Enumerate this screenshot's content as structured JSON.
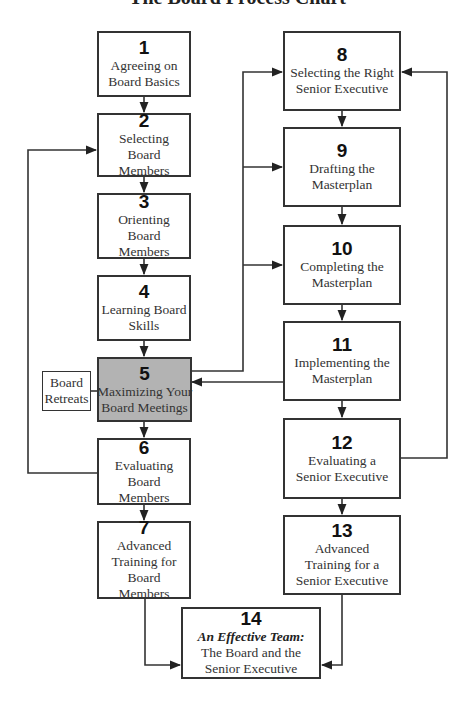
{
  "title": "The Board Process Chart",
  "colors": {
    "box_border": "#333333",
    "highlight_fill": "#b3b3b3",
    "background": "#ffffff"
  },
  "boxes": {
    "b1": {
      "number": "1",
      "line1": "Agreeing on",
      "line2": "Board Basics"
    },
    "b2": {
      "number": "2",
      "line1": "Selecting Board",
      "line2": "Members"
    },
    "b3": {
      "number": "3",
      "line1": "Orienting Board",
      "line2": "Members"
    },
    "b4": {
      "number": "4",
      "line1": "Learning Board",
      "line2": "Skills"
    },
    "b5": {
      "number": "5",
      "line1": "Maximizing Your",
      "line2": "Board Meetings",
      "highlighted": true
    },
    "b6": {
      "number": "6",
      "line1": "Evaluating",
      "line2": "Board Members"
    },
    "b7": {
      "number": "7",
      "line1": "Advanced",
      "line2": "Training for",
      "line3": "Board Members"
    },
    "b8": {
      "number": "8",
      "line1": "Selecting the Right",
      "line2": "Senior Executive"
    },
    "b9": {
      "number": "9",
      "line1": "Drafting the",
      "line2": "Masterplan"
    },
    "b10": {
      "number": "10",
      "line1": "Completing the",
      "line2": "Masterplan"
    },
    "b11": {
      "number": "11",
      "line1": "Implementing the",
      "line2": "Masterplan"
    },
    "b12": {
      "number": "12",
      "line1": "Evaluating a",
      "line2": "Senior Executive"
    },
    "b13": {
      "number": "13",
      "line1": "Advanced",
      "line2": "Training for a",
      "line3": "Senior Executive"
    },
    "b14": {
      "number": "14",
      "emphasis": "An Effective Team:",
      "line1": "The Board and the",
      "line2": "Senior Executive"
    }
  },
  "side_note": {
    "line1": "Board",
    "line2": "Retreats"
  },
  "connections": [
    {
      "from": "1",
      "to": "2"
    },
    {
      "from": "2",
      "to": "3"
    },
    {
      "from": "3",
      "to": "4"
    },
    {
      "from": "4",
      "to": "5"
    },
    {
      "from": "5",
      "to": "6"
    },
    {
      "from": "6",
      "to": "7"
    },
    {
      "from": "6",
      "to": "2",
      "type": "loop"
    },
    {
      "from": "5",
      "to": "8"
    },
    {
      "from": "5",
      "to": "9"
    },
    {
      "from": "5",
      "to": "10"
    },
    {
      "from": "8",
      "to": "9"
    },
    {
      "from": "9",
      "to": "10"
    },
    {
      "from": "10",
      "to": "11"
    },
    {
      "from": "11",
      "to": "5"
    },
    {
      "from": "11",
      "to": "12"
    },
    {
      "from": "12",
      "to": "13"
    },
    {
      "from": "12",
      "to": "8",
      "type": "loop"
    },
    {
      "from": "7",
      "to": "14"
    },
    {
      "from": "13",
      "to": "14"
    },
    {
      "from": "Board Retreats",
      "to": "5",
      "type": "attached"
    }
  ]
}
